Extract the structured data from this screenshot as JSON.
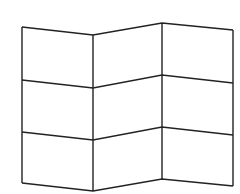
{
  "figure": {
    "stroke_color": "#222222",
    "background": "#ffffff",
    "stroke_width": 1.4,
    "columns_x": [
      22,
      93,
      162,
      233
    ],
    "rows": [
      {
        "name": "top",
        "y": [
          27,
          35,
          23,
          30
        ]
      },
      {
        "name": "row-line-1",
        "y": [
          80,
          88,
          75,
          83
        ]
      },
      {
        "name": "row-line-2",
        "y": [
          132,
          140,
          127,
          135
        ]
      },
      {
        "name": "bottom",
        "y": [
          183,
          191,
          179,
          186
        ]
      }
    ]
  }
}
